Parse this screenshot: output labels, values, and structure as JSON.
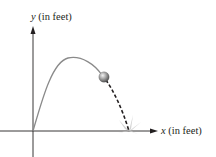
{
  "diagram": {
    "y_axis": {
      "variable": "y",
      "unit": "(in feet)"
    },
    "x_axis": {
      "variable": "x",
      "unit": "(in feet)"
    },
    "colors": {
      "axis": "#231f20",
      "curve": "#8a8a8a",
      "dashed_path": "#231f20",
      "ball_light": "#e6e6e6",
      "ball_dark": "#5a5a5a",
      "splash": "#c8c8c8"
    },
    "elements": [
      "y-axis with arrow",
      "x-axis with arrow",
      "solid parabolic trajectory from origin",
      "ball at current position",
      "dashed remaining trajectory",
      "impact splash on x-axis"
    ]
  }
}
